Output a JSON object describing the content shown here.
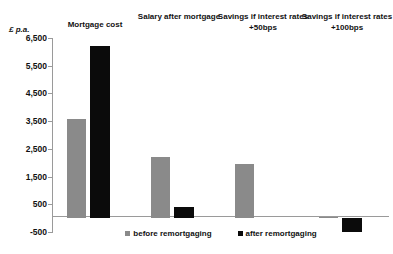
{
  "chart_data": {
    "type": "bar",
    "title": "",
    "xlabel": "",
    "ylabel": "£ p.a.",
    "categories": [
      "Mortgage cost",
      "Salary after mortgage",
      "Savings if interest rates +50bps",
      "Savings if interest rates +100bps"
    ],
    "series": [
      {
        "name": "before remortgaging",
        "color": "#8a8a8a",
        "values": [
          3560,
          2200,
          1950,
          50
        ]
      },
      {
        "name": "after remortgaging",
        "color": "#0b0b0b",
        "values": [
          6200,
          400,
          0,
          -500
        ]
      }
    ],
    "ylim": [
      -500,
      6500
    ],
    "ytick_values": [
      6500,
      5500,
      4500,
      3500,
      2500,
      1500,
      500,
      -500
    ],
    "ytick_labels": [
      "6,500",
      "5,500",
      "4,500",
      "3,500",
      "2,500",
      "1,500",
      "500",
      "-500"
    ],
    "grid": false,
    "legend_position": "bottom",
    "zero_line": true
  },
  "legend": {
    "entries": [
      {
        "label": "before remortgaging"
      },
      {
        "label": "after remortgaging"
      }
    ]
  }
}
